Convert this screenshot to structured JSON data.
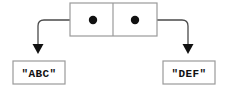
{
  "diagram": {
    "type": "cons-cell-box-and-pointer",
    "background_color": "#ffffff",
    "box_border_color": "#9a9a9a",
    "pointer_color": "#4a4a4a",
    "dot_color": "#111111",
    "text_color": "#111111",
    "cons_cell": {
      "name": "cons-cell",
      "x": 70,
      "y": 3,
      "width": 87,
      "height": 33,
      "divider_x": 113,
      "car": {
        "name": "car-slot",
        "dot_cx": 93,
        "dot_cy": 20,
        "dot_r": 4.2,
        "points_to": "\"ABC\""
      },
      "cdr": {
        "name": "cdr-slot",
        "dot_cx": 135,
        "dot_cy": 20,
        "dot_r": 4.2,
        "points_to": "\"DEF\""
      }
    },
    "value_boxes": [
      {
        "id": "abc",
        "label": "\"ABC\"",
        "x": 13,
        "y": 61,
        "width": 52,
        "height": 23,
        "text_x": 39,
        "text_y": 77
      },
      {
        "id": "def",
        "label": "\"DEF\"",
        "x": 163,
        "y": 61,
        "width": 52,
        "height": 23,
        "text_x": 189,
        "text_y": 77
      }
    ],
    "pointers": [
      {
        "id": "car-pointer",
        "from": "car-slot",
        "to": "abc",
        "path": "M 93 20 L 44 20 Q 38 20 38 26 L 38 45",
        "arrow_tip_x": 38,
        "arrow_tip_y": 54,
        "arrow_base_y": 44,
        "arrow_half_width": 5.5
      },
      {
        "id": "cdr-pointer",
        "from": "cdr-slot",
        "to": "def",
        "path": "M 135 20 L 182 20 Q 188 20 188 26 L 188 45",
        "arrow_tip_x": 188,
        "arrow_tip_y": 54,
        "arrow_base_y": 44,
        "arrow_half_width": 5.5
      }
    ]
  }
}
